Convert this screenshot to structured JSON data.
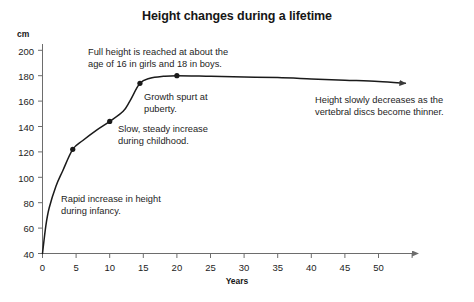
{
  "chart_data": {
    "type": "line",
    "title": "Height changes during a lifetime",
    "xlabel": "Years",
    "ylabel": "cm",
    "xlim": [
      0,
      56
    ],
    "ylim": [
      40,
      205
    ],
    "grid": false,
    "legend": "none",
    "x_ticks": [
      "0",
      "5",
      "10",
      "15",
      "20",
      "25",
      "30",
      "35",
      "40",
      "45",
      "50"
    ],
    "x_tick_values": [
      0,
      5,
      10,
      15,
      20,
      25,
      30,
      35,
      40,
      45,
      50
    ],
    "y_ticks": [
      "40",
      "60",
      "80",
      "100",
      "120",
      "140",
      "160",
      "180",
      "200"
    ],
    "y_tick_values": [
      40,
      60,
      80,
      100,
      120,
      140,
      160,
      180,
      200
    ],
    "series": [
      {
        "name": "Height",
        "x": [
          0,
          0.5,
          1,
          2,
          3,
          4.5,
          6,
          8,
          10,
          12,
          13,
          14.5,
          16,
          18,
          20,
          25,
          30,
          35,
          40,
          45,
          50,
          54
        ],
        "values": [
          40,
          62,
          76,
          93,
          105,
          122,
          129,
          137,
          144,
          152,
          160,
          174,
          178,
          179.5,
          180,
          179.5,
          179,
          178.5,
          177.5,
          176.5,
          175.5,
          174
        ]
      }
    ],
    "markers": [
      {
        "x": 4.5,
        "y": 122
      },
      {
        "x": 10,
        "y": 144
      },
      {
        "x": 14.5,
        "y": 174
      },
      {
        "x": 20,
        "y": 180
      }
    ],
    "annotations": [
      {
        "name": "full-height-note",
        "text": "Full height is reached at about the\nage of 16 in girls and 18 in boys."
      },
      {
        "name": "growth-spurt-note",
        "text": "Growth spurt at\npuberty."
      },
      {
        "name": "childhood-note",
        "text": "Slow, steady increase\nduring childhood."
      },
      {
        "name": "infancy-note",
        "text": "Rapid increase in height\nduring infancy."
      },
      {
        "name": "decline-note",
        "text": "Height slowly decreases as the\nvertebral discs become thinner."
      }
    ],
    "colors": {
      "line": "#1a1a1a",
      "axis": "#6d6d6d",
      "text": "#1d1d1d",
      "background": "#ffffff"
    }
  }
}
